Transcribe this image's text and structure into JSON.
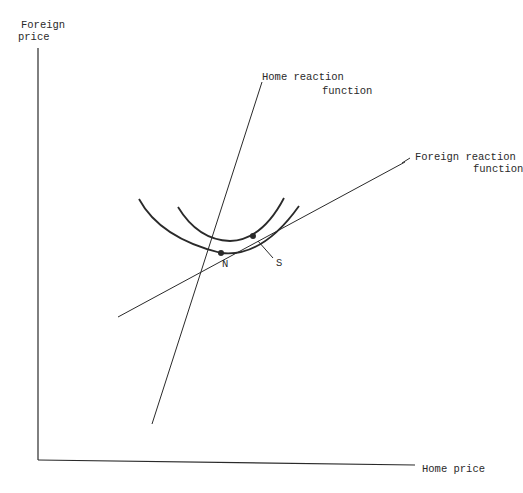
{
  "diagram": {
    "y_axis_label_line1": "Foreign",
    "y_axis_label_line2": "price",
    "x_axis_label": "Home price",
    "home_reaction_line1": "Home reaction",
    "home_reaction_line2": "function",
    "foreign_reaction_line1": "Foreign reaction",
    "foreign_reaction_line2": "function",
    "point_n": "N",
    "point_s": "S",
    "colors": {
      "line": "#2a2a2a",
      "background": "#ffffff"
    }
  }
}
